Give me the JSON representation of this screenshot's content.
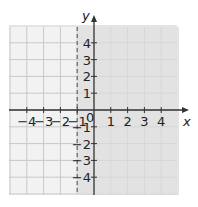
{
  "chart_data": {
    "type": "inequality-graph",
    "title": "",
    "inequality": "x > -1",
    "boundary": {
      "line": "x = -1",
      "style": "dashed"
    },
    "shaded_region": "x > -1",
    "xlabel": "x",
    "ylabel": "y",
    "xlim": [
      -5,
      5
    ],
    "ylim": [
      -5,
      5
    ],
    "x_ticks": [
      "-4",
      "-3",
      "-2",
      "-1",
      "1",
      "2",
      "3",
      "4"
    ],
    "y_ticks": [
      "4",
      "3",
      "2",
      "1",
      "-1",
      "-2",
      "-3",
      "-4"
    ],
    "origin_label": "0",
    "grid": true
  },
  "colors": {
    "shade": "#dcdcdc",
    "grid": "#c8c8c8",
    "axis": "#333333",
    "background_grid": "#f2f2f2"
  }
}
